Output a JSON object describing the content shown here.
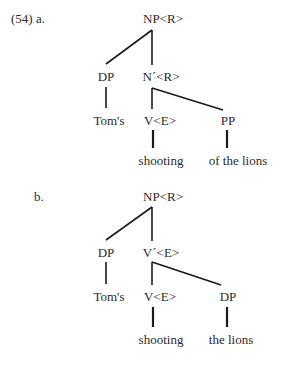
{
  "example_number": "(54)",
  "trees": [
    {
      "label": "a.",
      "root": "NP<R>",
      "left_child": "DP",
      "right_child": "N´<R>",
      "left_leaf": "Tom's",
      "head": "V<E>",
      "complement": "PP",
      "head_word": "shooting",
      "complement_words": "of the lions"
    },
    {
      "label": "b.",
      "root": "NP<R>",
      "left_child": "DP",
      "right_child": "V´<E>",
      "left_leaf": "Tom's",
      "head": "V<E>",
      "complement": "DP",
      "head_word": "shooting",
      "complement_words": "the lions"
    }
  ],
  "line_color": "#1a1a1a"
}
